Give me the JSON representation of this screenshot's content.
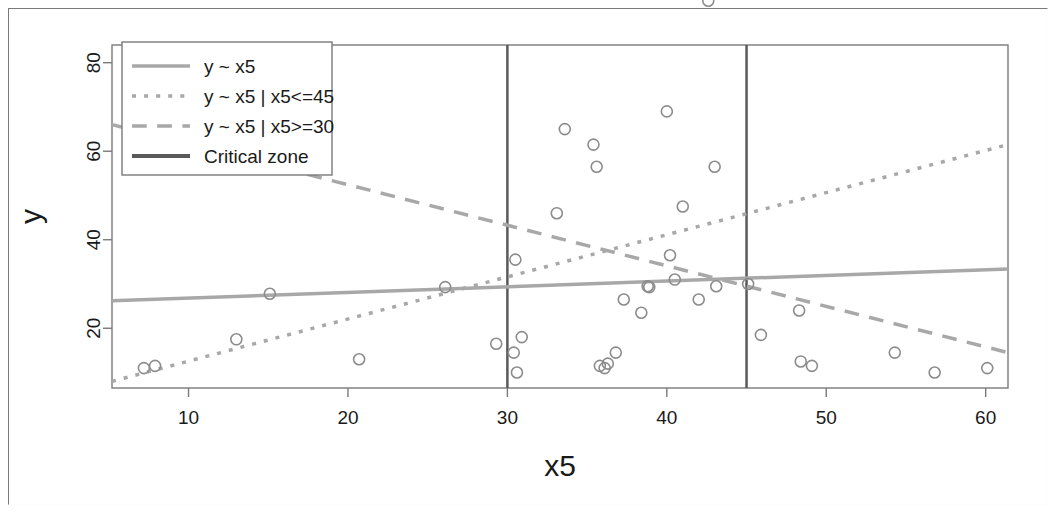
{
  "chart_data": {
    "type": "scatter",
    "title": "",
    "xlabel": "x5",
    "ylabel": "y",
    "xlim": [
      5.2,
      61.4
    ],
    "ylim": [
      6.5,
      84
    ],
    "grid": false,
    "xticks": [
      10,
      20,
      30,
      40,
      50,
      60
    ],
    "yticks": [
      20,
      40,
      60,
      80,
      100
    ],
    "xtick_labels": [
      "10",
      "20",
      "30",
      "40",
      "50",
      "60"
    ],
    "ytick_labels": [
      "20",
      "40",
      "60",
      "80",
      "100"
    ],
    "points": [
      {
        "x": 7.2,
        "y": 11.0
      },
      {
        "x": 7.9,
        "y": 11.5
      },
      {
        "x": 13.0,
        "y": 17.5
      },
      {
        "x": 15.1,
        "y": 27.8
      },
      {
        "x": 20.7,
        "y": 13.0
      },
      {
        "x": 26.1,
        "y": 29.3
      },
      {
        "x": 29.3,
        "y": 16.5
      },
      {
        "x": 30.4,
        "y": 14.5
      },
      {
        "x": 30.5,
        "y": 35.5
      },
      {
        "x": 30.6,
        "y": 10.0
      },
      {
        "x": 30.9,
        "y": 18.0
      },
      {
        "x": 33.1,
        "y": 46.0
      },
      {
        "x": 33.6,
        "y": 65.0
      },
      {
        "x": 34.4,
        "y": 110.0
      },
      {
        "x": 35.4,
        "y": 61.5
      },
      {
        "x": 35.6,
        "y": 56.5
      },
      {
        "x": 35.8,
        "y": 11.5
      },
      {
        "x": 36.1,
        "y": 11.0
      },
      {
        "x": 36.3,
        "y": 12.0
      },
      {
        "x": 36.8,
        "y": 14.5
      },
      {
        "x": 37.3,
        "y": 26.5
      },
      {
        "x": 38.4,
        "y": 23.5
      },
      {
        "x": 38.8,
        "y": 29.5
      },
      {
        "x": 38.9,
        "y": 29.3
      },
      {
        "x": 40.0,
        "y": 69.0
      },
      {
        "x": 40.2,
        "y": 36.5
      },
      {
        "x": 40.5,
        "y": 31.0
      },
      {
        "x": 41.0,
        "y": 47.5
      },
      {
        "x": 42.0,
        "y": 26.5
      },
      {
        "x": 42.6,
        "y": 94.0
      },
      {
        "x": 43.0,
        "y": 56.5
      },
      {
        "x": 43.1,
        "y": 29.5
      },
      {
        "x": 45.1,
        "y": 30.0
      },
      {
        "x": 45.9,
        "y": 18.5
      },
      {
        "x": 48.3,
        "y": 24.0
      },
      {
        "x": 48.4,
        "y": 12.5
      },
      {
        "x": 49.1,
        "y": 11.5
      },
      {
        "x": 54.3,
        "y": 14.5
      },
      {
        "x": 56.8,
        "y": 10.0
      },
      {
        "x": 60.1,
        "y": 11.0
      }
    ],
    "lines": [
      {
        "name": "y ~ x5",
        "style": "solid",
        "color": "#a8a8a8",
        "width": 3.5,
        "x0": 5.2,
        "y0": 26.2,
        "x1": 61.4,
        "y1": 33.4
      },
      {
        "name": "y ~ x5 | x5<=45",
        "style": "dotted",
        "color": "#a8a8a8",
        "width": 3.5,
        "x0": 5.2,
        "y0": 8.0,
        "x1": 61.4,
        "y1": 61.5
      },
      {
        "name": "y ~ x5 | x5>=30",
        "style": "dashed",
        "color": "#a8a8a8",
        "width": 3.5,
        "x0": 5.2,
        "y0": 66.0,
        "x1": 61.4,
        "y1": 14.5
      }
    ],
    "vlines": [
      {
        "name": "Critical zone",
        "x": 30,
        "color": "#5a5a5a",
        "width": 2.5
      },
      {
        "name": "Critical zone",
        "x": 45,
        "color": "#5a5a5a",
        "width": 2.5
      }
    ],
    "point_style": {
      "marker": "open-circle",
      "radius": 5.5,
      "color": "#8c8c8c",
      "width": 1.6
    },
    "legend": {
      "position": "top-left",
      "entries": [
        {
          "label": "y ~ x5",
          "style": "solid",
          "color": "#a8a8a8"
        },
        {
          "label": "y ~ x5 | x5<=45",
          "style": "dotted",
          "color": "#a8a8a8"
        },
        {
          "label": "y ~ x5 | x5>=30",
          "style": "dashed",
          "color": "#a8a8a8"
        },
        {
          "label": "Critical zone",
          "style": "solid",
          "color": "#5a5a5a"
        }
      ]
    }
  },
  "figure": {
    "background": "#ffffff",
    "frame_color": "#7a7a7a",
    "axis_title_x": "x5",
    "axis_title_y": "y"
  }
}
